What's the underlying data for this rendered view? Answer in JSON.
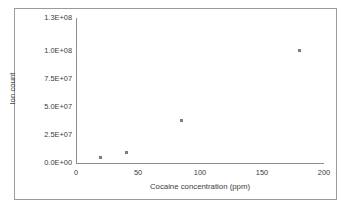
{
  "chart_data": {
    "type": "scatter",
    "title": "",
    "xlabel": "Cocaine concentration (ppm)",
    "ylabel": "Ion count",
    "xlim": [
      0,
      200
    ],
    "ylim": [
      0,
      130000000
    ],
    "grid": false,
    "legend": "none",
    "xticks": [
      "0",
      "50",
      "100",
      "150",
      "200"
    ],
    "xtick_values": [
      0,
      50,
      100,
      150,
      200
    ],
    "yticks": [
      "0.0E+00",
      "2.5E+07",
      "5.0E+07",
      "7.5E+07",
      "1.0E+08",
      "1.3E+08"
    ],
    "ytick_values": [
      0,
      25000000,
      50000000,
      75000000,
      100000000,
      130000000
    ],
    "series": [
      {
        "name": "Ion count",
        "marker": "square",
        "color": "#7d7d7d",
        "x": [
          20,
          41,
          85,
          180
        ],
        "y": [
          4500000,
          9500000,
          38000000,
          101000000
        ]
      }
    ]
  },
  "style": {
    "border_color": "#9a9a9a",
    "axis_color": "#8d8d8d",
    "text_color": "#3b3b3b",
    "marker_color": "#7d7d7d",
    "background": "#ffffff"
  }
}
